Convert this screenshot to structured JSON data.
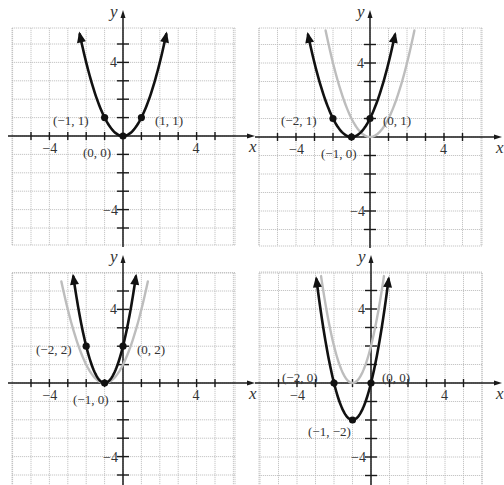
{
  "chart_data": [
    {
      "type": "line",
      "panel": "top-left",
      "title": "",
      "xlabel": "x",
      "ylabel": "y",
      "xlim": [
        -6,
        6
      ],
      "ylim": [
        -6,
        6
      ],
      "grid": true,
      "tick_labels": {
        "x": [
          "-4",
          "4"
        ],
        "y": [
          "4",
          "-4"
        ]
      },
      "series": [
        {
          "name": "main",
          "equation": "y = x^2",
          "a": 1,
          "h": 0,
          "k": 0,
          "color": "#111111",
          "x_range": [
            -2.35,
            2.35
          ]
        }
      ],
      "points": [
        {
          "x": -1,
          "y": 1,
          "label": "(−1, 1)"
        },
        {
          "x": 1,
          "y": 1,
          "label": "(1, 1)"
        },
        {
          "x": 0,
          "y": 0,
          "label": "(0, 0)"
        }
      ]
    },
    {
      "type": "line",
      "panel": "top-right",
      "title": "",
      "xlabel": "x",
      "ylabel": "y",
      "xlim": [
        -6,
        6
      ],
      "ylim": [
        -6,
        6
      ],
      "grid": true,
      "tick_labels": {
        "x": [
          "-4",
          "4"
        ],
        "y": [
          "4",
          "-4"
        ]
      },
      "series": [
        {
          "name": "reference",
          "equation": "y = x^2",
          "a": 1,
          "h": 0,
          "k": 0,
          "color": "#bdbdbd",
          "x_range": [
            -2.4,
            2.4
          ]
        },
        {
          "name": "main",
          "equation": "y = (x + 1)^2",
          "a": 1,
          "h": -1,
          "k": 0,
          "color": "#111111",
          "x_range": [
            -3.35,
            1.35
          ]
        }
      ],
      "points": [
        {
          "x": -2,
          "y": 1,
          "label": "(−2, 1)"
        },
        {
          "x": 0,
          "y": 1,
          "label": "(0, 1)"
        },
        {
          "x": -1,
          "y": 0,
          "label": "(−1, 0)"
        }
      ]
    },
    {
      "type": "line",
      "panel": "bottom-left",
      "title": "",
      "xlabel": "x",
      "ylabel": "y",
      "xlim": [
        -6,
        6
      ],
      "ylim": [
        -6,
        6
      ],
      "grid": true,
      "tick_labels": {
        "x": [
          "-4",
          "4"
        ],
        "y": [
          "4",
          "-4"
        ]
      },
      "series": [
        {
          "name": "reference",
          "equation": "y = (x + 1)^2",
          "a": 1,
          "h": -1,
          "k": 0,
          "color": "#bdbdbd",
          "x_range": [
            -3.35,
            1.35
          ]
        },
        {
          "name": "main",
          "equation": "y = 2(x + 1)^2",
          "a": 2,
          "h": -1,
          "k": 0,
          "color": "#111111",
          "x_range": [
            -2.7,
            0.7
          ]
        }
      ],
      "points": [
        {
          "x": -2,
          "y": 2,
          "label": "(−2, 2)"
        },
        {
          "x": 0,
          "y": 2,
          "label": "(0, 2)"
        },
        {
          "x": -1,
          "y": 0,
          "label": "(−1, 0)"
        }
      ]
    },
    {
      "type": "line",
      "panel": "bottom-right",
      "title": "",
      "xlabel": "x",
      "ylabel": "y",
      "xlim": [
        -6,
        6
      ],
      "ylim": [
        -6,
        6
      ],
      "grid": true,
      "tick_labels": {
        "x": [
          "-4",
          "4"
        ],
        "y": [
          "4",
          "-4"
        ]
      },
      "series": [
        {
          "name": "reference",
          "equation": "y = 2(x + 1)^2",
          "a": 2,
          "h": -1,
          "k": 0,
          "color": "#bdbdbd",
          "x_range": [
            -2.7,
            0.7
          ]
        },
        {
          "name": "main",
          "equation": "y = 2(x + 1)^2 - 2",
          "a": 2,
          "h": -1,
          "k": -2,
          "color": "#111111",
          "x_range": [
            -2.95,
            0.95
          ]
        }
      ],
      "points": [
        {
          "x": -2,
          "y": 0,
          "label": "(−2, 0)"
        },
        {
          "x": 0,
          "y": 0,
          "label": "(0, 0)"
        },
        {
          "x": -1,
          "y": -2,
          "label": "(−1, −2)"
        }
      ]
    }
  ],
  "panels": [
    {
      "id": "top-left",
      "origin_px": [
        123,
        136
      ],
      "unit_px": 18.4,
      "grid_px": {
        "left": 12,
        "top": 28,
        "right": 235,
        "bottom": 245
      },
      "axis_labels": {
        "x": "x",
        "y": "y"
      },
      "tick_labels": {
        "x_neg4": "−4",
        "x_pos4": "4",
        "y_pos4": "4",
        "y_neg4": "−4"
      },
      "point_labels": [
        {
          "text": "(−1, 1)",
          "px": [
            53,
            121
          ]
        },
        {
          "text": "(1, 1)",
          "px": [
            155,
            121
          ]
        },
        {
          "text": "(0, 0)",
          "px": [
            83,
            153
          ]
        }
      ]
    },
    {
      "id": "top-right",
      "origin_px": [
        370,
        137
      ],
      "unit_px": 18.5,
      "grid_px": {
        "left": 259,
        "top": 28,
        "right": 482,
        "bottom": 246
      },
      "axis_labels": {
        "x": "x",
        "y": "y"
      },
      "tick_labels": {
        "x_neg4": "−4",
        "x_pos4": "4",
        "y_pos4": "4",
        "y_neg4": "−4"
      },
      "point_labels": [
        {
          "text": "(−2, 1)",
          "px": [
            281,
            121
          ]
        },
        {
          "text": "(0, 1)",
          "px": [
            383,
            121
          ]
        },
        {
          "text": "(−1, 0)",
          "px": [
            321,
            154
          ]
        }
      ]
    },
    {
      "id": "bottom-left",
      "origin_px": [
        123,
        383
      ],
      "unit_px": 18.4,
      "grid_px": {
        "left": 12,
        "top": 273,
        "right": 235,
        "bottom": 485
      },
      "axis_labels": {
        "x": "x",
        "y": "y"
      },
      "tick_labels": {
        "x_neg4": "−4",
        "x_pos4": "4",
        "y_pos4": "4",
        "y_neg4": "−4"
      },
      "point_labels": [
        {
          "text": "(−2, 2)",
          "px": [
            36,
            350
          ]
        },
        {
          "text": "(0, 2)",
          "px": [
            137,
            350
          ]
        },
        {
          "text": "(−1, 0)",
          "px": [
            73,
            400
          ]
        }
      ]
    },
    {
      "id": "bottom-right",
      "origin_px": [
        371,
        383
      ],
      "unit_px": 18.5,
      "grid_px": {
        "left": 259,
        "top": 273,
        "right": 482,
        "bottom": 485
      },
      "axis_labels": {
        "x": "x",
        "y": "y"
      },
      "tick_labels": {
        "x_neg4": "−4",
        "x_pos4": "4",
        "y_pos4": "4",
        "y_neg4": "−4"
      },
      "point_labels": [
        {
          "text": "(−2, 0)",
          "px": [
            282,
            378
          ]
        },
        {
          "text": "(0, 0)",
          "px": [
            382,
            378
          ]
        },
        {
          "text": "(−1, −2)",
          "px": [
            308,
            432
          ]
        }
      ]
    }
  ]
}
